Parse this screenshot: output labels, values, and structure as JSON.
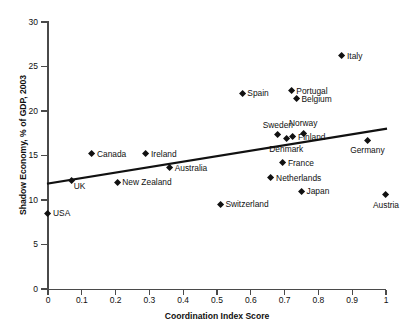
{
  "chart_data": {
    "type": "scatter",
    "title": "",
    "xlabel": "Coordination Index Score",
    "ylabel": "Shadow Economy, % of GDP, 2003",
    "xlim": [
      0,
      1
    ],
    "ylim": [
      0,
      30
    ],
    "xticks": [
      "0",
      "0.1",
      "0.2",
      "0.3",
      "0.4",
      "0.5",
      "0.6",
      "0.7",
      "0.8",
      "0.9",
      "1"
    ],
    "xtick_values": [
      0,
      0.1,
      0.2,
      0.3,
      0.4,
      0.5,
      0.6,
      0.7,
      0.8,
      0.9,
      1
    ],
    "yticks": [
      "0",
      "5",
      "10",
      "15",
      "20",
      "25",
      "30"
    ],
    "ytick_values": [
      0,
      5,
      10,
      15,
      20,
      25,
      30
    ],
    "grid": false,
    "legend": "none",
    "marker_shape": "diamond",
    "marker_color": "#111111",
    "points": [
      {
        "label": "USA",
        "x": 0.0,
        "y": 8.5,
        "label_pos": "right"
      },
      {
        "label": "UK",
        "x": 0.07,
        "y": 12.2,
        "label_pos": "below-right"
      },
      {
        "label": "Canada",
        "x": 0.13,
        "y": 15.2,
        "label_pos": "right"
      },
      {
        "label": "New Zealand",
        "x": 0.205,
        "y": 12.0,
        "label_pos": "right"
      },
      {
        "label": "Ireland",
        "x": 0.29,
        "y": 15.2,
        "label_pos": "right"
      },
      {
        "label": "Australia",
        "x": 0.36,
        "y": 13.6,
        "label_pos": "right"
      },
      {
        "label": "Switzerland",
        "x": 0.51,
        "y": 9.5,
        "label_pos": "right"
      },
      {
        "label": "Spain",
        "x": 0.575,
        "y": 22.0,
        "label_pos": "right"
      },
      {
        "label": "Netherlands",
        "x": 0.66,
        "y": 12.5,
        "label_pos": "right"
      },
      {
        "label": "Sweden",
        "x": 0.68,
        "y": 17.3,
        "label_pos": "above"
      },
      {
        "label": "France",
        "x": 0.695,
        "y": 14.2,
        "label_pos": "right"
      },
      {
        "label": "Denmark",
        "x": 0.705,
        "y": 16.9,
        "label_pos": "below"
      },
      {
        "label": "Portugal",
        "x": 0.72,
        "y": 22.3,
        "label_pos": "right"
      },
      {
        "label": "Finland",
        "x": 0.725,
        "y": 17.1,
        "label_pos": "right"
      },
      {
        "label": "Belgium",
        "x": 0.735,
        "y": 21.4,
        "label_pos": "right"
      },
      {
        "label": "Japan",
        "x": 0.75,
        "y": 11.0,
        "label_pos": "right"
      },
      {
        "label": "Norway",
        "x": 0.755,
        "y": 17.5,
        "label_pos": "above"
      },
      {
        "label": "Italy",
        "x": 0.87,
        "y": 26.2,
        "label_pos": "right"
      },
      {
        "label": "Germany",
        "x": 0.945,
        "y": 16.7,
        "label_pos": "below"
      },
      {
        "label": "Austria",
        "x": 1.0,
        "y": 10.6,
        "label_pos": "below"
      }
    ],
    "trendline": {
      "x_start": 0.0,
      "y_start": 11.85,
      "x_end": 1.0,
      "y_end": 18.0,
      "color": "#111111"
    }
  }
}
